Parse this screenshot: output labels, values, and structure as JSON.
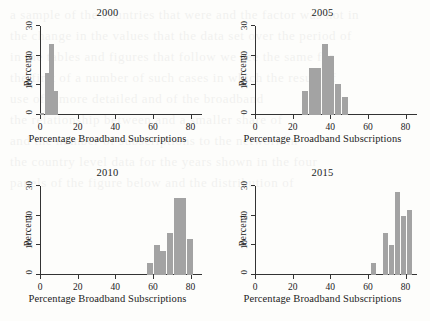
{
  "figure": {
    "axis_x_title": "Percentage Broadband Subscriptions",
    "axis_y_title": "Percent",
    "bar_color": "#a3a3a3",
    "axis_color": "#333333"
  },
  "bleed_text": "a sample of the countries that were and the factor was not in\nthe change in the values that the data set over the period of\nin the tables and figures that follow we see the same for\nthe first of a number of such cases in which the result of\nuse of a more detailed and of the broadband\nthe relationship between and a smaller share of\nand the number of subscriptions to the network in\nthe country level data for the years shown in the four\npanels of the figure below and the distribution of",
  "chart_data": [
    {
      "type": "bar",
      "title": "2000",
      "xlabel": "Percentage Broadband Subscriptions",
      "ylabel": "Percent",
      "xlim": [
        0,
        85
      ],
      "ylim": [
        0,
        30
      ],
      "xticks": [
        0,
        20,
        40,
        60,
        80
      ],
      "yticks": [
        0,
        10,
        20,
        30
      ],
      "grid": false,
      "legend": "none",
      "bin_width": 2.5,
      "bins": [
        {
          "x0": 0.0,
          "x1": 2.5,
          "value": 0.8
        },
        {
          "x0": 2.5,
          "x1": 5.0,
          "value": 14.0
        },
        {
          "x0": 5.0,
          "x1": 7.5,
          "value": 24.0
        },
        {
          "x0": 7.5,
          "x1": 10.0,
          "value": 8.2
        }
      ]
    },
    {
      "type": "bar",
      "title": "2005",
      "xlabel": "Percentage Broadband Subscriptions",
      "ylabel": "Percent",
      "xlim": [
        0,
        85
      ],
      "ylim": [
        0,
        30
      ],
      "xticks": [
        0,
        20,
        40,
        60,
        80
      ],
      "yticks": [
        0,
        10,
        20,
        30
      ],
      "grid": false,
      "legend": "none",
      "bin_width": 3.5,
      "bins": [
        {
          "x0": 25.0,
          "x1": 28.5,
          "value": 8.0
        },
        {
          "x0": 28.5,
          "x1": 32.0,
          "value": 16.0
        },
        {
          "x0": 32.0,
          "x1": 35.5,
          "value": 16.0
        },
        {
          "x0": 35.5,
          "x1": 39.0,
          "value": 24.0
        },
        {
          "x0": 39.0,
          "x1": 42.5,
          "value": 20.0
        },
        {
          "x0": 42.5,
          "x1": 46.0,
          "value": 10.5
        },
        {
          "x0": 46.0,
          "x1": 49.5,
          "value": 6.0
        }
      ]
    },
    {
      "type": "bar",
      "title": "2010",
      "xlabel": "Percentage Broadband Subscriptions",
      "ylabel": "Percent",
      "xlim": [
        0,
        85
      ],
      "ylim": [
        0,
        30
      ],
      "xticks": [
        0,
        20,
        40,
        60,
        80
      ],
      "yticks": [
        0,
        10,
        20,
        30
      ],
      "grid": false,
      "legend": "none",
      "bin_width": 3.5,
      "bins": [
        {
          "x0": 57.0,
          "x1": 60.5,
          "value": 4.0
        },
        {
          "x0": 60.5,
          "x1": 64.0,
          "value": 10.0
        },
        {
          "x0": 64.0,
          "x1": 67.5,
          "value": 8.0
        },
        {
          "x0": 67.5,
          "x1": 71.0,
          "value": 14.0
        },
        {
          "x0": 71.0,
          "x1": 74.5,
          "value": 26.0
        },
        {
          "x0": 74.5,
          "x1": 78.0,
          "value": 26.0
        },
        {
          "x0": 78.0,
          "x1": 81.5,
          "value": 12.0
        }
      ]
    },
    {
      "type": "bar",
      "title": "2015",
      "xlabel": "Percentage Broadband Subscriptions",
      "ylabel": "Percent",
      "xlim": [
        0,
        85
      ],
      "ylim": [
        0,
        30
      ],
      "xticks": [
        0,
        20,
        40,
        60,
        80
      ],
      "yticks": [
        0,
        10,
        20,
        30
      ],
      "grid": false,
      "legend": "none",
      "bin_width": 3.2,
      "bins": [
        {
          "x0": 61.5,
          "x1": 64.7,
          "value": 4.0
        },
        {
          "x0": 67.9,
          "x1": 71.1,
          "value": 14.0
        },
        {
          "x0": 71.1,
          "x1": 74.3,
          "value": 10.0
        },
        {
          "x0": 74.3,
          "x1": 77.5,
          "value": 28.0
        },
        {
          "x0": 77.5,
          "x1": 80.7,
          "value": 20.0
        },
        {
          "x0": 80.7,
          "x1": 83.9,
          "value": 22.0
        }
      ]
    }
  ]
}
